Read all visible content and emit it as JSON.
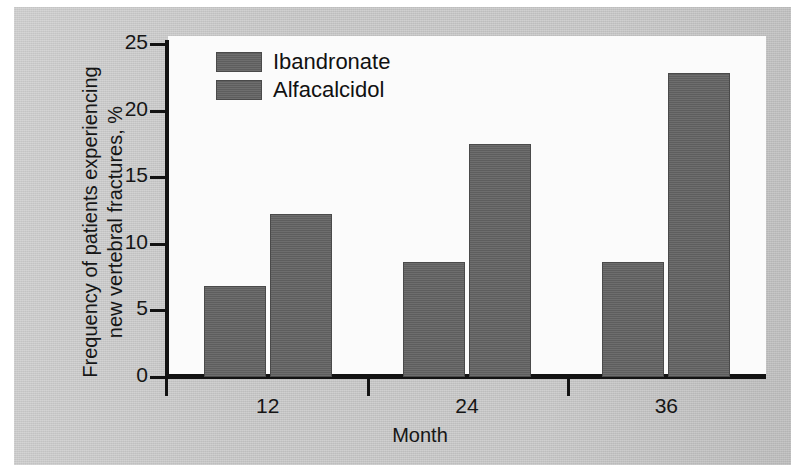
{
  "figure": {
    "background_color": "#c8c8c8",
    "plot_background_color": "#fbfbfb",
    "axis_color": "#131313"
  },
  "chart_data": {
    "type": "bar",
    "title": "",
    "subtitle": "",
    "xlabel": "Month",
    "ylabel": "Frequency of patients experiencing\nnew vertebral fractures, %",
    "categories": [
      "12",
      "24",
      "36"
    ],
    "series": [
      {
        "name": "Ibandronate",
        "color": "#636363",
        "values": [
          6.8,
          8.6,
          8.6
        ]
      },
      {
        "name": "Alfacalcidol",
        "color": "#636363",
        "values": [
          12.2,
          17.5,
          22.8
        ]
      }
    ],
    "ylim": [
      0,
      25
    ],
    "yticks": [
      0,
      5,
      10,
      15,
      20,
      25
    ],
    "ytick_labels": [
      "0",
      "5",
      "10",
      "15",
      "20",
      "25"
    ],
    "xtick_labels": [
      "12",
      "24",
      "36"
    ],
    "grid": false,
    "legend_position": "top-left",
    "legend_entries": [
      "Ibandronate",
      "Alfacalcidol"
    ]
  }
}
